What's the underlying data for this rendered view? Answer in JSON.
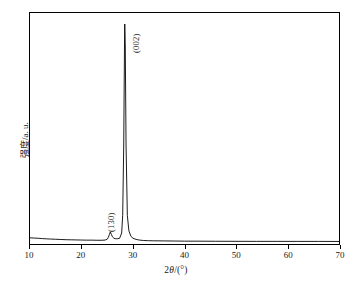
{
  "figure": {
    "background_color": "#ffffff",
    "line_color": "#000000"
  },
  "axes": {
    "x_title_prefix": "2",
    "x_title_theta": "θ",
    "x_title_suffix": "/(°)",
    "x_title_full": "2θ/(°)",
    "y_title": "强度/a. u.",
    "x_ticks": [
      "10",
      "20",
      "30",
      "40",
      "50",
      "60",
      "70"
    ]
  },
  "annotations": {
    "peak_002": "(002)",
    "peak_130": "(130)"
  },
  "chart_data": {
    "type": "line",
    "title": "",
    "subtitle": "",
    "xlabel": "2θ/(°)",
    "ylabel": "强度/a. u.",
    "xlim": [
      10,
      70
    ],
    "ylim": [
      0,
      1.05
    ],
    "xticks": [
      10,
      20,
      30,
      40,
      50,
      60,
      70
    ],
    "yticks": [],
    "grid": false,
    "legend": null,
    "legend_position": "none",
    "annotations": [
      {
        "text": "(130)",
        "x": 25.6,
        "y": 0.07,
        "rotation": 90
      },
      {
        "text": "(002)",
        "x": 28.4,
        "y": 0.92,
        "rotation": 90
      }
    ],
    "peaks": [
      {
        "label": "(130)",
        "two_theta": 25.6,
        "relative_intensity": 0.055
      },
      {
        "label": "(002)",
        "two_theta": 28.4,
        "relative_intensity": 1.0
      }
    ],
    "x": [
      10.0,
      10.8,
      11.6,
      12.4,
      13.2,
      14.0,
      15.0,
      16.0,
      17.0,
      18.0,
      19.0,
      20.0,
      21.0,
      22.0,
      23.0,
      24.0,
      24.6,
      25.0,
      25.2,
      25.4,
      25.6,
      25.8,
      26.0,
      26.3,
      26.6,
      27.0,
      27.4,
      27.8,
      28.0,
      28.2,
      28.35,
      28.4,
      28.5,
      28.65,
      28.9,
      29.2,
      29.6,
      30.0,
      30.6,
      31.2,
      32.0,
      33.0,
      34.0,
      36.0,
      38.0,
      40.0,
      43.0,
      46.0,
      50.0,
      54.0,
      58.0,
      62.0,
      66.0,
      70.0
    ],
    "y": [
      0.028,
      0.027,
      0.026,
      0.0245,
      0.0235,
      0.0225,
      0.0215,
      0.0205,
      0.0195,
      0.019,
      0.0185,
      0.018,
      0.0175,
      0.0175,
      0.017,
      0.017,
      0.018,
      0.022,
      0.03,
      0.042,
      0.055,
      0.044,
      0.033,
      0.026,
      0.024,
      0.024,
      0.026,
      0.05,
      0.13,
      0.45,
      0.9,
      1.0,
      0.9,
      0.45,
      0.13,
      0.06,
      0.035,
      0.026,
      0.021,
      0.018,
      0.016,
      0.015,
      0.0145,
      0.014,
      0.0135,
      0.013,
      0.0128,
      0.0125,
      0.0122,
      0.012,
      0.012,
      0.0118,
      0.0118,
      0.0115
    ]
  }
}
